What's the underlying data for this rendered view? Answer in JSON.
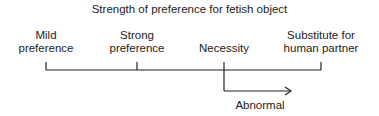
{
  "title": "Strength of preference for fetish object",
  "scale_labels": [
    {
      "line1": "Mild",
      "line2": "preference"
    },
    {
      "line1": "Strong",
      "line2": "preference"
    },
    {
      "line1": "",
      "line2": "Necessity"
    },
    {
      "line1": "Substitute for",
      "line2": "human partner"
    }
  ],
  "arrow_label": "Abnormal",
  "colors": {
    "line": "#222222",
    "text": "#222222",
    "background": "#ffffff"
  }
}
